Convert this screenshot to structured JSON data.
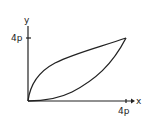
{
  "diagram": {
    "axes": {
      "x_label": "x",
      "y_label": "y"
    },
    "ticks": {
      "x_tick": "4p",
      "y_tick": "4p"
    },
    "curves": [
      {
        "name": "y^2 = 4px",
        "description": "upper curve from origin to (4p, 4p)"
      },
      {
        "name": "x^2 = 4py",
        "description": "lower curve from origin to (4p, 4p)"
      }
    ],
    "intersection_points": [
      "(0, 0)",
      "(4p, 4p)"
    ],
    "stroke_color": "#222222"
  }
}
